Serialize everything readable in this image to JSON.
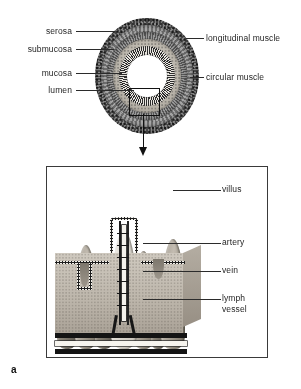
{
  "figure": {
    "marker": "a",
    "type": "anatomical-diagram"
  },
  "cross_section": {
    "labels_left": [
      {
        "id": "serosa",
        "text": "serosa"
      },
      {
        "id": "submucosa",
        "text": "submucosa"
      },
      {
        "id": "mucosa",
        "text": "mucosa"
      },
      {
        "id": "lumen",
        "text": "lumen"
      }
    ],
    "labels_right": [
      {
        "id": "longitudinal-muscle",
        "text": "longitudinal muscle"
      },
      {
        "id": "circular-muscle",
        "text": "circular muscle"
      }
    ],
    "inset": {
      "name": "magnification-box",
      "arrow": "down-arrow"
    }
  },
  "villus_panel": {
    "labels_right": [
      {
        "id": "villus",
        "text": "villus"
      },
      {
        "id": "artery",
        "text": "artery"
      },
      {
        "id": "vein",
        "text": "vein"
      },
      {
        "id": "lymph-vessel",
        "text": "lymph\nvessel"
      }
    ],
    "lymph_line1": "lymph",
    "lymph_line2": "vessel"
  },
  "colors": {
    "ink": "#262626",
    "leader": "#2b2b2b",
    "paper": "#ffffff",
    "tissue": "#bcb5aa",
    "vessel": "#171717"
  }
}
